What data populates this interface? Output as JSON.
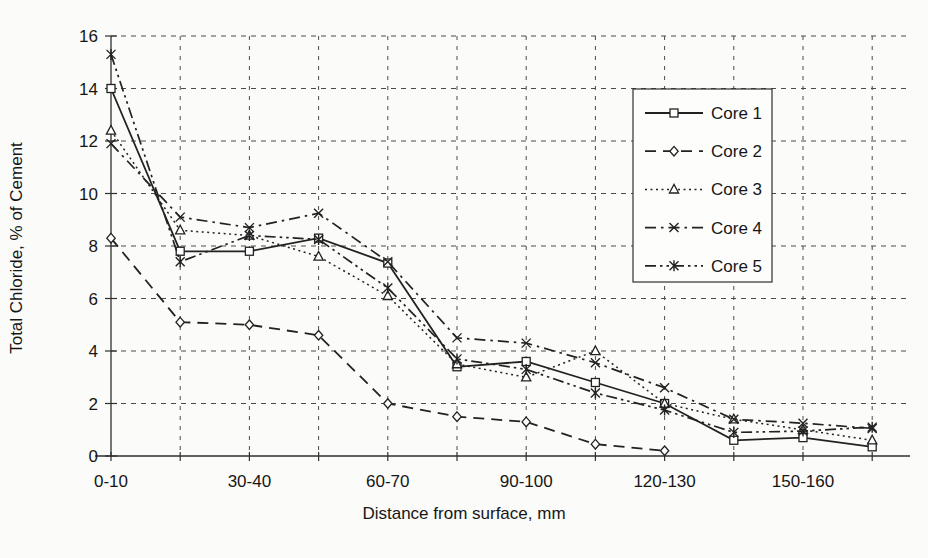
{
  "figure": {
    "background": "#fbfbf9",
    "ink": "#222222",
    "grid_color": "#4a4a4a"
  },
  "chart_data": {
    "type": "line",
    "title": "",
    "xlabel": "Distance from surface, mm",
    "ylabel": "Total Chloride, % of Cement",
    "x_tick_labels": [
      "0-10",
      "",
      "30-40",
      "",
      "60-70",
      "",
      "90-100",
      "",
      "120-130",
      "",
      "150-160",
      ""
    ],
    "y_ticks": [
      0,
      2,
      4,
      6,
      8,
      10,
      12,
      14,
      16
    ],
    "ylim": [
      0,
      16
    ],
    "grid": "dashed-both-axes",
    "legend_position": "upper-right",
    "legend_labels": [
      "Core 1",
      "Core 2",
      "Core 3",
      "Core 4",
      "Core 5"
    ],
    "series": [
      {
        "name": "Core 1",
        "line": "solid",
        "marker": "square",
        "values": [
          14.0,
          7.8,
          7.8,
          8.3,
          7.35,
          3.4,
          3.6,
          2.8,
          2.0,
          0.6,
          0.7,
          0.35
        ]
      },
      {
        "name": "Core 2",
        "line": "dashed",
        "marker": "diamond",
        "values": [
          8.3,
          5.1,
          5.0,
          4.6,
          2.0,
          1.5,
          1.3,
          0.45,
          0.2,
          null,
          null,
          null
        ]
      },
      {
        "name": "Core 3",
        "line": "dotted",
        "marker": "triangle",
        "values": [
          12.4,
          8.6,
          8.4,
          7.6,
          6.1,
          3.5,
          3.0,
          4.0,
          2.0,
          1.4,
          1.0,
          0.6
        ]
      },
      {
        "name": "Core 4",
        "line": "dashdot",
        "marker": "x",
        "values": [
          11.9,
          9.1,
          8.7,
          9.25,
          7.4,
          4.5,
          4.3,
          3.55,
          2.6,
          1.4,
          1.25,
          1.05
        ]
      },
      {
        "name": "Core 5",
        "line": "dashdotdot",
        "marker": "asterisk",
        "values": [
          15.3,
          7.4,
          8.4,
          8.25,
          6.4,
          3.7,
          3.3,
          2.4,
          1.75,
          0.9,
          0.95,
          1.1
        ]
      }
    ]
  }
}
